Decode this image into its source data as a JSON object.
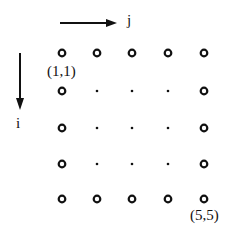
{
  "diagram": {
    "axis_j_label": "j",
    "axis_i_label": "i",
    "corner_top_left_label": "(1,1)",
    "corner_bottom_right_label": "(5,5)",
    "grid": {
      "rows": 5,
      "cols": 5,
      "boundary_marker": "open-circle",
      "interior_marker": "dot"
    }
  }
}
